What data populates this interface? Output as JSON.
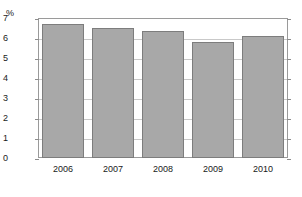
{
  "chart_data": {
    "type": "bar",
    "title": "",
    "subtitle": "",
    "xlabel": "",
    "ylabel": "",
    "unit_label": "%",
    "categories": [
      "2006",
      "2007",
      "2008",
      "2009",
      "2010"
    ],
    "values": [
      6.7,
      6.5,
      6.35,
      5.8,
      6.1
    ],
    "series": [
      {
        "name": "",
        "values": [
          6.7,
          6.5,
          6.35,
          5.8,
          6.1
        ]
      }
    ],
    "ylim": [
      0,
      7
    ],
    "yticks": [
      0,
      1,
      2,
      3,
      4,
      5,
      6,
      7
    ],
    "ytick_labels": [
      "0",
      "1",
      "2",
      "3",
      "4",
      "5",
      "6",
      "7"
    ],
    "grid": true,
    "grid_axis": "y",
    "legend": false,
    "legend_position": "none",
    "annotations": [],
    "colors": {
      "bar_fill": "#a8a8a8",
      "bar_border": "#7d7d7d",
      "gridline": "#c9c9c9",
      "frame": "#9a9a9a",
      "tick": "#8d8d8d",
      "text": "#1a1a1a",
      "background": "#ffffff"
    }
  }
}
